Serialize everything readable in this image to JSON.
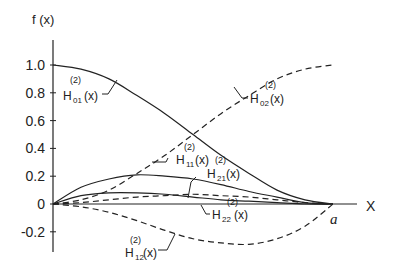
{
  "chart_data": {
    "type": "line",
    "title": "",
    "xlabel": "X",
    "ylabel": "f (x)",
    "x_end_label": "a",
    "xlim": [
      0,
      1
    ],
    "ylim": [
      -0.3,
      1.1
    ],
    "yticks": [
      "1.0",
      "0.8",
      "0.6",
      "0.4",
      "0.2",
      "0",
      "-0.2"
    ],
    "ytick_values": [
      1.0,
      0.8,
      0.6,
      0.4,
      0.2,
      0,
      -0.2
    ],
    "grid": false,
    "legend": "inline annotations with leader arrows",
    "x": [
      0,
      0.1,
      0.2,
      0.3,
      0.4,
      0.5,
      0.6,
      0.7,
      0.8,
      0.9,
      1.0
    ],
    "series": [
      {
        "name": "H01(2)(x)",
        "style": "solid",
        "values": [
          1.0,
          0.97,
          0.9,
          0.78,
          0.65,
          0.5,
          0.35,
          0.22,
          0.1,
          0.03,
          0.0
        ]
      },
      {
        "name": "H02(2)(x)",
        "style": "dashed",
        "values": [
          0.0,
          0.03,
          0.1,
          0.22,
          0.35,
          0.5,
          0.65,
          0.78,
          0.9,
          0.97,
          1.0
        ]
      },
      {
        "name": "H11(2)(x)",
        "style": "solid",
        "values": [
          0.0,
          0.12,
          0.18,
          0.21,
          0.2,
          0.18,
          0.14,
          0.09,
          0.05,
          0.01,
          0.0
        ]
      },
      {
        "name": "H12(2)(x)",
        "style": "dashed",
        "values": [
          0.0,
          -0.02,
          -0.06,
          -0.12,
          -0.19,
          -0.25,
          -0.28,
          -0.29,
          -0.25,
          -0.16,
          0.0
        ]
      },
      {
        "name": "H21(2)(x)",
        "style": "solid",
        "values": [
          0.0,
          0.06,
          0.08,
          0.08,
          0.07,
          0.05,
          0.03,
          0.02,
          0.01,
          0.0,
          0.0
        ]
      },
      {
        "name": "H22(2)(x)",
        "style": "dashed",
        "values": [
          0.0,
          0.01,
          0.03,
          0.05,
          0.06,
          0.07,
          0.06,
          0.05,
          0.03,
          0.01,
          0.0
        ]
      }
    ],
    "annotations": [
      {
        "main": "H",
        "sub": "01",
        "sup": "(2)",
        "arg": "(x)"
      },
      {
        "main": "H",
        "sub": "02",
        "sup": "(2)",
        "arg": "(x)"
      },
      {
        "main": "H",
        "sub": "11",
        "sup": "(2)",
        "arg": "(x)"
      },
      {
        "main": "H",
        "sub": "21",
        "sup": "(2)",
        "arg": "(x)"
      },
      {
        "main": "H",
        "sub": "22",
        "sup": "(2)",
        "arg": "(x)"
      },
      {
        "main": "H",
        "sub": "12",
        "sup": "(2)",
        "arg": "(x)"
      }
    ]
  }
}
